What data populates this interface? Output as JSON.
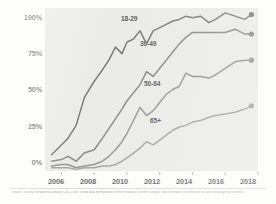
{
  "chart_data": {
    "type": "line",
    "title": "",
    "subtitle": "",
    "xlabel": "",
    "ylabel": "",
    "xlim": [
      2005,
      2018
    ],
    "ylim": [
      0,
      100
    ],
    "grid": false,
    "legend_position": "inline-labels",
    "y_ticks": [
      "0%",
      "25%",
      "50%",
      "75%",
      "100%"
    ],
    "y_tick_values": [
      0,
      25,
      50,
      75,
      100
    ],
    "x_ticks": [
      "2006",
      "2008",
      "2010",
      "2012",
      "2014",
      "2016",
      "2018"
    ],
    "x_tick_values": [
      2006,
      2008,
      2010,
      2012,
      2014,
      2016,
      2018
    ],
    "x": [
      2005.4,
      2006.0,
      2006.4,
      2006.9,
      2007.4,
      2008.0,
      2008.5,
      2008.9,
      2009.3,
      2009.7,
      2010.0,
      2010.4,
      2010.8,
      2011.2,
      2011.6,
      2012.0,
      2012.4,
      2012.8,
      2013.2,
      2013.6,
      2014.0,
      2014.5,
      2015.0,
      2015.4,
      2016.0,
      2016.6,
      2017.2,
      2017.6
    ],
    "series": [
      {
        "name": "18-29",
        "label": "18-29",
        "color": "#6b6b6d",
        "endpoint_value": 96,
        "values": [
          10,
          16,
          20,
          28,
          45,
          55,
          62,
          68,
          76,
          72,
          79,
          81,
          86,
          78,
          86,
          88,
          90,
          92,
          93,
          95,
          94,
          95,
          91,
          93,
          97,
          95,
          93,
          96
        ]
      },
      {
        "name": "30-49",
        "label": "30-49",
        "color": "#7c7c7e",
        "endpoint_value": 84,
        "values": [
          6,
          7,
          9,
          6,
          11,
          13,
          20,
          26,
          32,
          38,
          43,
          48,
          53,
          61,
          58,
          63,
          68,
          73,
          78,
          82,
          85,
          85,
          85,
          85,
          85,
          87,
          84,
          84
        ]
      },
      {
        "name": "50-64",
        "label": "50-64",
        "color": "#8a8a8c",
        "endpoint_value": 68,
        "values": [
          3,
          4,
          4,
          2,
          3,
          4,
          6,
          9,
          13,
          18,
          23,
          31,
          39,
          34,
          37,
          42,
          47,
          50,
          52,
          60,
          58,
          58,
          57,
          59,
          63,
          67,
          68,
          68
        ]
      },
      {
        "name": "65+",
        "label": "65+",
        "color": "#9a9a9c",
        "endpoint_value": 40,
        "values": [
          2,
          2,
          2,
          1,
          2,
          2,
          3,
          3,
          4,
          6,
          8,
          11,
          14,
          18,
          16,
          19,
          22,
          25,
          27,
          28,
          30,
          31,
          33,
          34,
          35,
          36,
          38,
          40
        ]
      }
    ],
    "colors": {
      "plot_background": "#e9e9e7",
      "page_background": "#fdfdfc",
      "axis_text": "#57575a",
      "series_18_29": "#6b6b6d",
      "series_30_49": "#7c7c7e",
      "series_50_64": "#8a8a8c",
      "series_65_plus": "#9a9a9c"
    }
  },
  "axes": {
    "y_labels": [
      {
        "text": "100%",
        "value": 100
      },
      {
        "text": "75%",
        "value": 75
      },
      {
        "text": "50%",
        "value": 50
      },
      {
        "text": "25%",
        "value": 25
      },
      {
        "text": "0%",
        "value": 0
      }
    ],
    "x_labels": [
      {
        "text": "2006",
        "value": 2006
      },
      {
        "text": "2008",
        "value": 2008
      },
      {
        "text": "2010",
        "value": 2010
      },
      {
        "text": "2012",
        "value": 2012
      },
      {
        "text": "2014",
        "value": 2014
      },
      {
        "text": "2016",
        "value": 2016
      },
      {
        "text": "2018",
        "value": 2018
      }
    ]
  },
  "series_labels": [
    {
      "text": "18-29"
    },
    {
      "text": "30-49"
    },
    {
      "text": "50-64"
    },
    {
      "text": "65+"
    }
  ],
  "footnote": {
    "text": "Source: Survey conducted January 3-10, 2018. Trend data from previous Pew Research Center surveys. Social media use continues to rise in developing countries."
  }
}
